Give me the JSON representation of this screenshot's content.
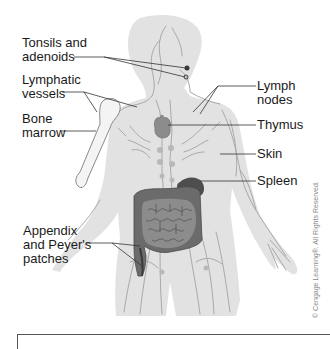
{
  "figure": {
    "labels": {
      "tonsils": "Tonsils and\nadenoids",
      "lymphatic_vessels": "Lymphatic\nvessels",
      "bone_marrow": "Bone\nmarrow",
      "appendix": "Appendix\nand Peyer's\npatches",
      "lymph_nodes": "Lymph\nnodes",
      "thymus": "Thymus",
      "skin": "Skin",
      "spleen": "Spleen"
    },
    "credit": "© Cengage Learning®. All Rights Reserved.",
    "colors": {
      "body_fill": "#e2e2e2",
      "vessel": "#a9a9a9",
      "organ_dark": "#6b6b6b",
      "organ_mid": "#8c8c8c",
      "bone": "#f4f4f4",
      "leader": "#333333"
    }
  }
}
